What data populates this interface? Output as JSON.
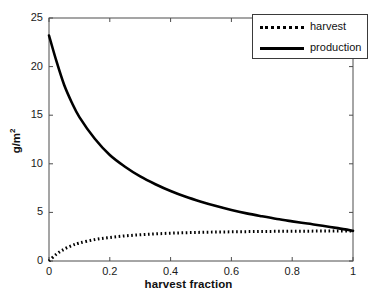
{
  "chart_data": {
    "type": "line",
    "title": "",
    "xlabel": "harvest fraction",
    "ylabel": "g/m2",
    "ylabel_display": "g/m",
    "ylabel_exponent": "2",
    "xlim": [
      0,
      1
    ],
    "ylim": [
      0,
      25
    ],
    "xticks": [
      0,
      0.2,
      0.4,
      0.6,
      0.8,
      1
    ],
    "xticklabels": [
      "0",
      "0.2",
      "0.4",
      "0.6",
      "0.8",
      "1"
    ],
    "yticks": [
      0,
      5,
      10,
      15,
      20,
      25
    ],
    "yticklabels": [
      "0",
      "5",
      "10",
      "15",
      "20",
      "25"
    ],
    "grid": false,
    "legend_position": "top-right",
    "legend_entries": [
      "harvest",
      "production"
    ],
    "x": [
      0,
      0.025,
      0.05,
      0.075,
      0.1,
      0.15,
      0.2,
      0.25,
      0.3,
      0.35,
      0.4,
      0.45,
      0.5,
      0.55,
      0.6,
      0.65,
      0.7,
      0.75,
      0.8,
      0.85,
      0.9,
      0.95,
      1
    ],
    "series": [
      {
        "name": "harvest",
        "style": "dotted",
        "color": "#000000",
        "values": [
          0.0,
          0.72,
          1.22,
          1.58,
          1.85,
          2.2,
          2.42,
          2.58,
          2.7,
          2.79,
          2.86,
          2.91,
          2.95,
          2.98,
          3.0,
          3.02,
          3.04,
          3.05,
          3.06,
          3.07,
          3.08,
          3.09,
          3.1
        ]
      },
      {
        "name": "production",
        "style": "solid",
        "color": "#000000",
        "values": [
          23.2,
          20.5,
          18.1,
          16.3,
          14.8,
          12.6,
          10.9,
          9.7,
          8.7,
          7.9,
          7.2,
          6.6,
          6.1,
          5.65,
          5.25,
          4.9,
          4.6,
          4.32,
          4.08,
          3.85,
          3.63,
          3.38,
          3.1
        ]
      }
    ]
  },
  "axes": {
    "plot_left": 49,
    "plot_right": 353,
    "plot_top": 18,
    "plot_bottom": 261,
    "frame_color": "#4d4d4d"
  }
}
